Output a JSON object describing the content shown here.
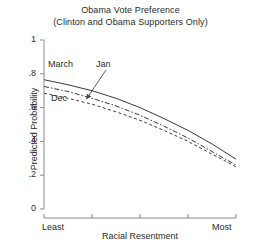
{
  "chart_data": {
    "type": "line",
    "title": "Obama Vote Preference",
    "subtitle": "(Clinton and Obama Supporters Only)",
    "xlabel": "Racial Resentment",
    "ylabel": "Predicted Probability",
    "ylim": [
      0,
      1
    ],
    "xlim": [
      0,
      1
    ],
    "grid": false,
    "legend_position": "inline-annotations",
    "yticks": [
      "0",
      ".2",
      ".4",
      ".6",
      ".8",
      "1"
    ],
    "ytick_values": [
      0,
      0.2,
      0.4,
      0.6,
      0.8,
      1
    ],
    "xticks": [
      "Least",
      "",
      "",
      "",
      "Most"
    ],
    "xtick_values": [
      0,
      0.25,
      0.5,
      0.75,
      1
    ],
    "x": [
      0,
      0.125,
      0.25,
      0.375,
      0.5,
      0.625,
      0.75,
      0.875,
      1
    ],
    "series": [
      {
        "name": "March",
        "style": "solid",
        "color": "#3b3b3b",
        "values": [
          0.765,
          0.735,
          0.7,
          0.655,
          0.6,
          0.535,
          0.465,
          0.385,
          0.295
        ]
      },
      {
        "name": "Jan",
        "style": "dash-dot",
        "color": "#3b3b3b",
        "values": [
          0.725,
          0.695,
          0.655,
          0.61,
          0.555,
          0.49,
          0.42,
          0.34,
          0.26
        ]
      },
      {
        "name": "Dec",
        "style": "dashed",
        "color": "#3b3b3b",
        "values": [
          0.685,
          0.655,
          0.62,
          0.575,
          0.525,
          0.465,
          0.4,
          0.325,
          0.25
        ]
      }
    ],
    "annotations": [
      {
        "text": "March",
        "target_series": "March"
      },
      {
        "text": "Jan",
        "target_series": "Jan",
        "arrow": true
      },
      {
        "text": "Dec",
        "target_series": "Dec"
      }
    ]
  },
  "axis_color": "#8a8a8a"
}
